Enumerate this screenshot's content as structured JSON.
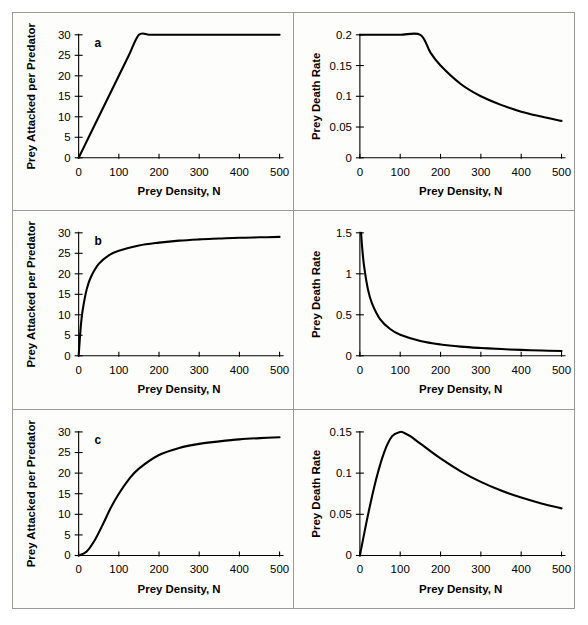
{
  "figure": {
    "layout": "2 columns x 3 rows",
    "columns": [
      "functional response",
      "prey death rate"
    ],
    "rows": [
      "a",
      "b",
      "c"
    ]
  },
  "axis_titles": {
    "x": "Prey Density, N",
    "y_left": "Prey Attacked per Predator",
    "y_right": "Prey Death Rate"
  },
  "panel_letters": {
    "a": "a",
    "b": "b",
    "c": "c"
  },
  "chart_data": [
    {
      "id": "a-left",
      "type": "line",
      "title": "",
      "panel_letter": "a",
      "xlabel": "Prey Density, N",
      "ylabel": "Prey Attacked per Predator",
      "xlim": [
        0,
        500
      ],
      "ylim": [
        0,
        30
      ],
      "xticks": [
        0,
        100,
        200,
        300,
        400,
        500
      ],
      "yticks": [
        0,
        5,
        10,
        15,
        20,
        25,
        30
      ],
      "grid": false,
      "legend": "none",
      "model": "Type I functional response: linear then plateau",
      "x": [
        0,
        25,
        50,
        75,
        100,
        125,
        150,
        175,
        200,
        250,
        300,
        350,
        400,
        450,
        500
      ],
      "values": [
        0,
        5,
        10,
        15,
        20,
        25,
        30,
        30,
        30,
        30,
        30,
        30,
        30,
        30,
        30
      ]
    },
    {
      "id": "a-right",
      "type": "line",
      "title": "",
      "panel_letter": "",
      "xlabel": "Prey Density, N",
      "ylabel": "Prey Death Rate",
      "xlim": [
        0,
        500
      ],
      "ylim": [
        0,
        0.2
      ],
      "xticks": [
        0,
        100,
        200,
        300,
        400,
        500
      ],
      "yticks": [
        0,
        0.05,
        0.1,
        0.15,
        0.2
      ],
      "grid": false,
      "legend": "none",
      "model": "Type I death rate: constant 0.2 to N=150, then 30/N",
      "x": [
        0,
        50,
        100,
        150,
        175,
        200,
        250,
        300,
        350,
        400,
        450,
        500
      ],
      "values": [
        0.2,
        0.2,
        0.2,
        0.2,
        0.171,
        0.15,
        0.12,
        0.1,
        0.086,
        0.075,
        0.067,
        0.06
      ]
    },
    {
      "id": "b-left",
      "type": "line",
      "title": "",
      "panel_letter": "b",
      "xlabel": "Prey Density, N",
      "ylabel": "Prey Attacked per Predator",
      "xlim": [
        0,
        500
      ],
      "ylim": [
        0,
        30
      ],
      "xticks": [
        0,
        100,
        200,
        300,
        400,
        500
      ],
      "yticks": [
        0,
        5,
        10,
        15,
        20,
        25,
        30
      ],
      "grid": false,
      "legend": "none",
      "model": "Type II functional response: 30N/(N+17)",
      "x": [
        0,
        5,
        10,
        20,
        30,
        50,
        75,
        100,
        150,
        200,
        250,
        300,
        350,
        400,
        450,
        500
      ],
      "values": [
        0,
        6.8,
        11.1,
        16.2,
        19.1,
        22.4,
        24.5,
        25.6,
        26.9,
        27.6,
        28.1,
        28.4,
        28.6,
        28.8,
        28.9,
        29.0
      ]
    },
    {
      "id": "b-right",
      "type": "line",
      "title": "",
      "panel_letter": "",
      "xlabel": "Prey Density, N",
      "ylabel": "Prey Death Rate",
      "xlim": [
        0,
        500
      ],
      "ylim": [
        0,
        1.5
      ],
      "xticks": [
        0,
        100,
        200,
        300,
        400,
        500
      ],
      "yticks": [
        0,
        0.5,
        1,
        1.5
      ],
      "grid": false,
      "legend": "none",
      "model": "Type II death rate: 30/(N+17)",
      "x": [
        3,
        5,
        10,
        20,
        30,
        50,
        75,
        100,
        150,
        200,
        250,
        300,
        350,
        400,
        450,
        500
      ],
      "values": [
        1.5,
        1.36,
        1.11,
        0.81,
        0.64,
        0.448,
        0.326,
        0.256,
        0.18,
        0.138,
        0.112,
        0.095,
        0.082,
        0.072,
        0.064,
        0.058
      ]
    },
    {
      "id": "c-left",
      "type": "line",
      "title": "",
      "panel_letter": "c",
      "xlabel": "Prey Density, N",
      "ylabel": "Prey Attacked per Predator",
      "xlim": [
        0,
        500
      ],
      "ylim": [
        0,
        30
      ],
      "xticks": [
        0,
        100,
        200,
        300,
        400,
        500
      ],
      "yticks": [
        0,
        5,
        10,
        15,
        20,
        25,
        30
      ],
      "grid": false,
      "legend": "none",
      "model": "Type III functional response: 30N^2/(N^2+110^2)",
      "x": [
        0,
        20,
        40,
        60,
        80,
        100,
        125,
        150,
        200,
        250,
        300,
        350,
        400,
        450,
        500
      ],
      "values": [
        0,
        0.98,
        3.7,
        7.5,
        11.6,
        15.0,
        18.5,
        21.1,
        24.4,
        26.1,
        27.1,
        27.7,
        28.2,
        28.5,
        28.7
      ]
    },
    {
      "id": "c-right",
      "type": "line",
      "title": "",
      "panel_letter": "",
      "xlabel": "Prey Density, N",
      "ylabel": "Prey Death Rate",
      "xlim": [
        0,
        500
      ],
      "ylim": [
        0,
        0.15
      ],
      "xticks": [
        0,
        100,
        200,
        300,
        400,
        500
      ],
      "yticks": [
        0,
        0.05,
        0.1,
        0.15
      ],
      "grid": false,
      "legend": "none",
      "model": "Type III death rate: 30N/(N^2+110^2), peak 0.136 near N=110",
      "x": [
        0,
        20,
        40,
        60,
        80,
        100,
        110,
        125,
        150,
        200,
        250,
        300,
        350,
        400,
        450,
        500
      ],
      "values": [
        0,
        0.049,
        0.092,
        0.125,
        0.1448,
        0.15,
        0.1488,
        0.1448,
        0.1358,
        0.1178,
        0.1022,
        0.0894,
        0.0789,
        0.0703,
        0.0632,
        0.0572
      ]
    }
  ]
}
